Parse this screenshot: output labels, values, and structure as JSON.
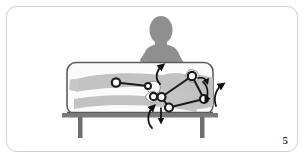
{
  "figure": {
    "number": "5",
    "caption_number_label": "5",
    "scene": "therapist-mobilizing-patient-knee-on-treatment-table",
    "frame": {
      "border_color": "#cfcfcf",
      "background_color": "#ffffff",
      "corner_radius": 10
    },
    "colors": {
      "therapist_silhouette": "#8f8f8f",
      "patient_body": "#b9b9b9",
      "patient_body_shadow": "#c9c9c9",
      "table_surface": "#fbfbfb",
      "table_outline": "#5c5c5c",
      "table_leg": "#6e6e6e",
      "table_top_band": "#7a7a7a",
      "joint_marker_fill": "#ffffff",
      "joint_marker_stroke": "#1c1c1c",
      "segment_line": "#1c1c1c",
      "arrow": "#111111",
      "hand_highlight": "#ffffff",
      "figure_number_text": "#3a3a3a"
    },
    "elements": {
      "therapist_label": "therapist silhouette",
      "patient_label": "patient lying supine",
      "table_label": "treatment table",
      "left_table_leg_label": "left table leg",
      "right_table_leg_label": "right table leg"
    },
    "joints": [
      {
        "id": "j1",
        "label": "distal-limb-marker-left",
        "cx": 116,
        "cy": 82.5,
        "r": 4.2
      },
      {
        "id": "j2",
        "label": "ankle-marker",
        "cx": 148,
        "cy": 86,
        "r": 3.0
      },
      {
        "id": "j3",
        "label": "therapist-lower-hand-marker",
        "cx": 153.5,
        "cy": 96.5,
        "r": 3.6
      },
      {
        "id": "j4",
        "label": "knee-marker",
        "cx": 161.5,
        "cy": 97,
        "r": 4.0
      },
      {
        "id": "j5",
        "label": "hip-marker",
        "cx": 169,
        "cy": 107.5,
        "r": 4.0
      },
      {
        "id": "j6",
        "label": "therapist-upper-hand-marker",
        "cx": 192,
        "cy": 76,
        "r": 4.2
      },
      {
        "id": "j7",
        "label": "pelvis-marker",
        "cx": 204,
        "cy": 99,
        "r": 4.0
      }
    ],
    "segments": [
      {
        "label": "segment-j1-j2",
        "from": "j1",
        "to": "j2"
      },
      {
        "label": "segment-j3-j4",
        "from": "j3",
        "to": "j4"
      },
      {
        "label": "segment-j4-j5",
        "from": "j4",
        "to": "j5"
      },
      {
        "label": "segment-j4-j6",
        "from": "j4",
        "to": "j6"
      },
      {
        "label": "segment-j5-j7",
        "from": "j5",
        "to": "j7"
      },
      {
        "label": "segment-j6-j7",
        "from": "j6",
        "to": "j7"
      }
    ],
    "arrows": [
      {
        "id": "a1",
        "label": "curved-arrow-up-center",
        "direction": "up",
        "type": "curved"
      },
      {
        "id": "a2",
        "label": "curved-arrow-up-lower-center",
        "direction": "up",
        "type": "curved"
      },
      {
        "id": "a3",
        "label": "straight-arrow-down-center",
        "direction": "down",
        "type": "straight"
      },
      {
        "id": "a4",
        "label": "curved-arrow-up-right",
        "direction": "up",
        "type": "curved"
      },
      {
        "id": "a5",
        "label": "curved-arrow-down-right-edge",
        "direction": "down",
        "type": "curved"
      },
      {
        "id": "a6",
        "label": "small-arrow-right-hand",
        "direction": "right",
        "type": "short"
      }
    ]
  }
}
